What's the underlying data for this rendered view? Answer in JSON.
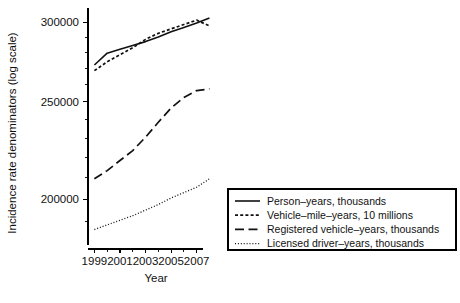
{
  "chart_data": {
    "type": "line",
    "title": "",
    "xlabel": "Year",
    "ylabel": "Incidence rate denominators (log scale)",
    "xlim": [
      1998.5,
      2008.2
    ],
    "ylim": [
      180000,
      310000
    ],
    "yscale": "log",
    "grid": false,
    "legend_position": "right",
    "x_tick_labels": [
      "1999",
      "2001",
      "2003",
      "2005",
      "2007"
    ],
    "x_ticks": [
      1999,
      2001,
      2003,
      2005,
      2007
    ],
    "y_tick_labels": [
      "300000",
      "250000",
      "200000"
    ],
    "y_ticks": [
      300000,
      250000,
      200000
    ],
    "y_minor_ticks": [
      190000,
      210000,
      220000,
      230000,
      240000,
      260000,
      270000,
      280000,
      290000
    ],
    "x": [
      1999,
      2000,
      2001,
      2002,
      2003,
      2004,
      2005,
      2006,
      2007,
      2008
    ],
    "series": [
      {
        "name": "Person-years, thousands",
        "style": "solid",
        "values": [
          272000,
          279500,
          282000,
          284500,
          287000,
          290000,
          293500,
          296500,
          299500,
          303000
        ]
      },
      {
        "name": "Vehicle-mile-years, 10 millions",
        "style": "dotted",
        "values": [
          268500,
          274000,
          278500,
          283000,
          288500,
          292500,
          295500,
          298500,
          301500,
          297500
        ]
      },
      {
        "name": "Registered vehicle-years, thousands",
        "style": "dashed",
        "values": [
          209500,
          213500,
          218500,
          223500,
          230500,
          238500,
          246500,
          252500,
          256500,
          257500
        ]
      },
      {
        "name": "Licensed driver-years, thousands",
        "style": "fine-dotted",
        "values": [
          186500,
          188500,
          190500,
          192500,
          195000,
          197500,
          200500,
          203000,
          205500,
          209500
        ]
      }
    ]
  },
  "legend": {
    "items": [
      {
        "label": "Person–years, thousands",
        "style": "solid"
      },
      {
        "label": "Vehicle–mile–years, 10 millions",
        "style": "dotted"
      },
      {
        "label": "Registered vehicle–years, thousands",
        "style": "dashed"
      },
      {
        "label": "Licensed driver–years, thousands",
        "style": "fine-dotted"
      }
    ]
  },
  "axes": {
    "x_title": "Year",
    "y_title": "Incidence rate denominators (log scale)",
    "x_labels": [
      "1999",
      "2001",
      "2003",
      "2005",
      "2007"
    ],
    "y_labels": [
      "300000",
      "250000",
      "200000"
    ]
  },
  "colors": {
    "ink": "#111111",
    "background": "#ffffff"
  }
}
